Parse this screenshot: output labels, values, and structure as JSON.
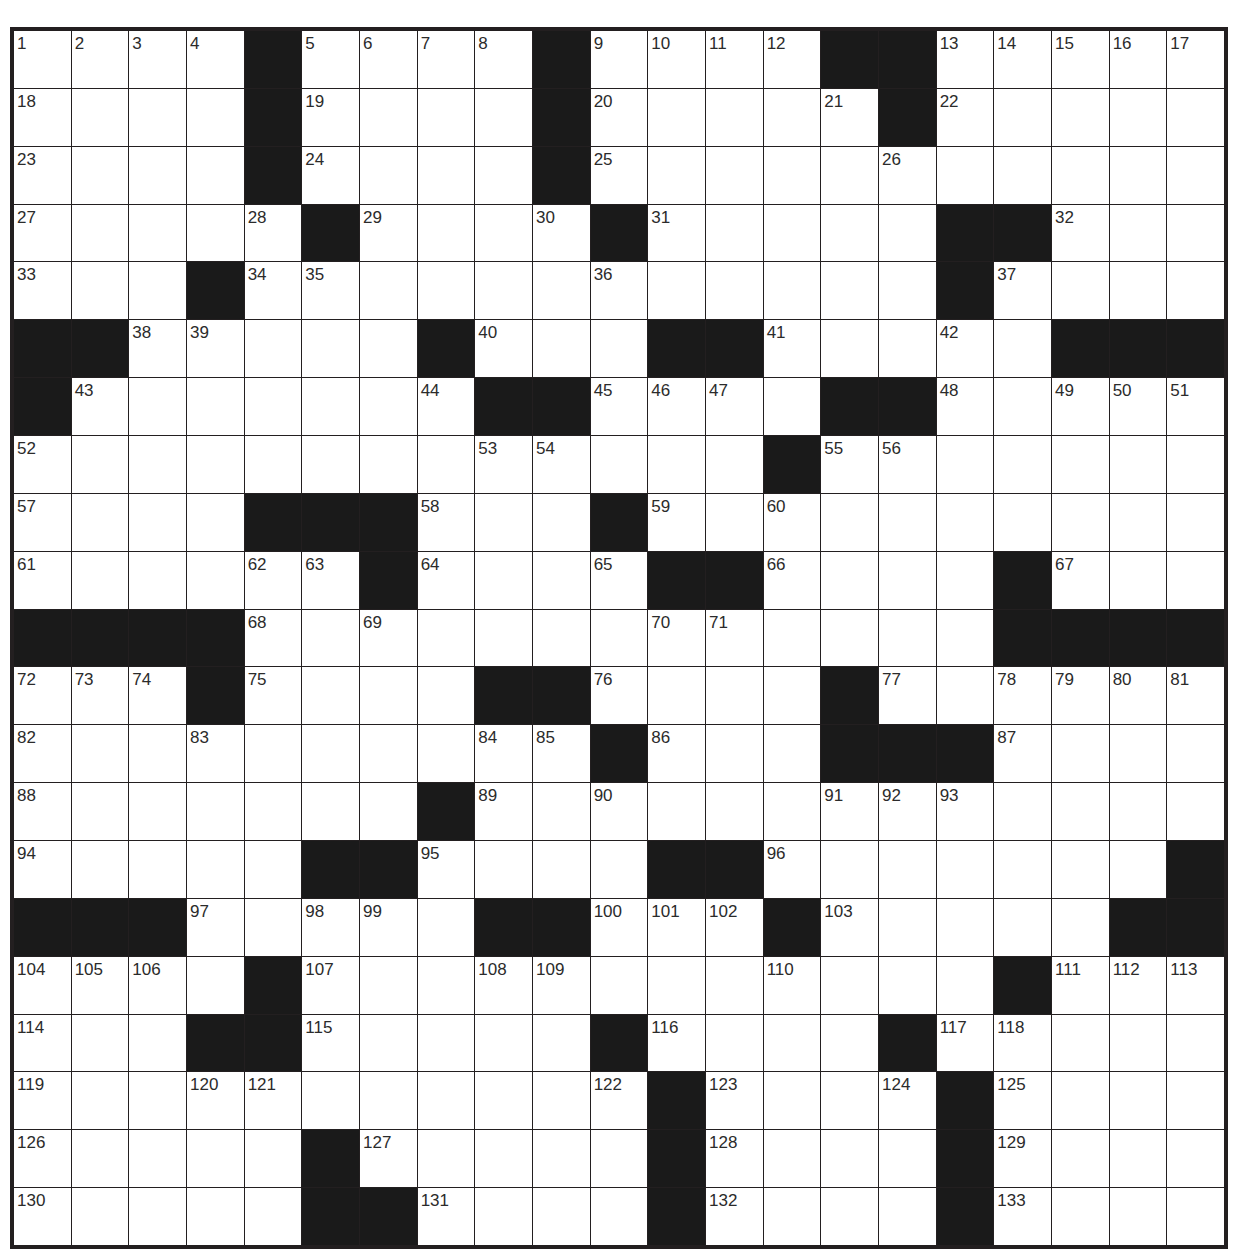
{
  "puzzle": {
    "type": "crossword",
    "size": {
      "rows": 21,
      "cols": 21
    },
    "colors": {
      "black_cell": "#1a1a1a",
      "white_cell": "#ffffff",
      "grid_line": "#231f20"
    },
    "layout": [
      "....#....#....##.....",
      "....#....#.....#.....",
      "....#....#...........",
      ".....#....#.....##...",
      "...#............#....",
      "##.....#...##.....###",
      "#.......##....##.....",
      ".............#.......",
      "....###...#..........",
      "......#....##....#...",
      "####.............####",
      "...#....##....#......",
      "..........#...###....",
      ".......#.............",
      ".....##....##.......#",
      "###.....##...#.....##",
      "....#............#...",
      "...##.....#....#.....",
      "...........#....#....",
      ".....#.....#....#....",
      ".....##....#....#...."
    ],
    "numbers": [
      {
        "r": 0,
        "c": 0,
        "n": "1"
      },
      {
        "r": 0,
        "c": 1,
        "n": "2"
      },
      {
        "r": 0,
        "c": 2,
        "n": "3"
      },
      {
        "r": 0,
        "c": 3,
        "n": "4"
      },
      {
        "r": 0,
        "c": 5,
        "n": "5"
      },
      {
        "r": 0,
        "c": 6,
        "n": "6"
      },
      {
        "r": 0,
        "c": 7,
        "n": "7"
      },
      {
        "r": 0,
        "c": 8,
        "n": "8"
      },
      {
        "r": 0,
        "c": 10,
        "n": "9"
      },
      {
        "r": 0,
        "c": 11,
        "n": "10"
      },
      {
        "r": 0,
        "c": 12,
        "n": "11"
      },
      {
        "r": 0,
        "c": 13,
        "n": "12"
      },
      {
        "r": 0,
        "c": 16,
        "n": "13"
      },
      {
        "r": 0,
        "c": 17,
        "n": "14"
      },
      {
        "r": 0,
        "c": 18,
        "n": "15"
      },
      {
        "r": 0,
        "c": 19,
        "n": "16"
      },
      {
        "r": 0,
        "c": 20,
        "n": "17"
      },
      {
        "r": 1,
        "c": 0,
        "n": "18"
      },
      {
        "r": 1,
        "c": 5,
        "n": "19"
      },
      {
        "r": 1,
        "c": 10,
        "n": "20"
      },
      {
        "r": 1,
        "c": 14,
        "n": "21"
      },
      {
        "r": 1,
        "c": 16,
        "n": "22"
      },
      {
        "r": 2,
        "c": 0,
        "n": "23"
      },
      {
        "r": 2,
        "c": 5,
        "n": "24"
      },
      {
        "r": 2,
        "c": 10,
        "n": "25"
      },
      {
        "r": 2,
        "c": 15,
        "n": "26"
      },
      {
        "r": 3,
        "c": 0,
        "n": "27"
      },
      {
        "r": 3,
        "c": 4,
        "n": "28"
      },
      {
        "r": 3,
        "c": 6,
        "n": "29"
      },
      {
        "r": 3,
        "c": 9,
        "n": "30"
      },
      {
        "r": 3,
        "c": 11,
        "n": "31"
      },
      {
        "r": 3,
        "c": 18,
        "n": "32"
      },
      {
        "r": 4,
        "c": 0,
        "n": "33"
      },
      {
        "r": 4,
        "c": 4,
        "n": "34"
      },
      {
        "r": 4,
        "c": 5,
        "n": "35"
      },
      {
        "r": 4,
        "c": 10,
        "n": "36"
      },
      {
        "r": 4,
        "c": 17,
        "n": "37"
      },
      {
        "r": 5,
        "c": 2,
        "n": "38"
      },
      {
        "r": 5,
        "c": 3,
        "n": "39"
      },
      {
        "r": 5,
        "c": 8,
        "n": "40"
      },
      {
        "r": 5,
        "c": 13,
        "n": "41"
      },
      {
        "r": 5,
        "c": 16,
        "n": "42"
      },
      {
        "r": 6,
        "c": 1,
        "n": "43"
      },
      {
        "r": 6,
        "c": 7,
        "n": "44"
      },
      {
        "r": 6,
        "c": 10,
        "n": "45"
      },
      {
        "r": 6,
        "c": 11,
        "n": "46"
      },
      {
        "r": 6,
        "c": 12,
        "n": "47"
      },
      {
        "r": 6,
        "c": 16,
        "n": "48"
      },
      {
        "r": 6,
        "c": 18,
        "n": "49"
      },
      {
        "r": 6,
        "c": 19,
        "n": "50"
      },
      {
        "r": 6,
        "c": 20,
        "n": "51"
      },
      {
        "r": 7,
        "c": 0,
        "n": "52"
      },
      {
        "r": 7,
        "c": 8,
        "n": "53"
      },
      {
        "r": 7,
        "c": 9,
        "n": "54"
      },
      {
        "r": 7,
        "c": 14,
        "n": "55"
      },
      {
        "r": 7,
        "c": 15,
        "n": "56"
      },
      {
        "r": 8,
        "c": 0,
        "n": "57"
      },
      {
        "r": 8,
        "c": 7,
        "n": "58"
      },
      {
        "r": 8,
        "c": 11,
        "n": "59"
      },
      {
        "r": 8,
        "c": 13,
        "n": "60"
      },
      {
        "r": 9,
        "c": 0,
        "n": "61"
      },
      {
        "r": 9,
        "c": 4,
        "n": "62"
      },
      {
        "r": 9,
        "c": 5,
        "n": "63"
      },
      {
        "r": 9,
        "c": 7,
        "n": "64"
      },
      {
        "r": 9,
        "c": 10,
        "n": "65"
      },
      {
        "r": 9,
        "c": 13,
        "n": "66"
      },
      {
        "r": 9,
        "c": 18,
        "n": "67"
      },
      {
        "r": 10,
        "c": 4,
        "n": "68"
      },
      {
        "r": 10,
        "c": 6,
        "n": "69"
      },
      {
        "r": 10,
        "c": 11,
        "n": "70"
      },
      {
        "r": 10,
        "c": 12,
        "n": "71"
      },
      {
        "r": 11,
        "c": 0,
        "n": "72"
      },
      {
        "r": 11,
        "c": 1,
        "n": "73"
      },
      {
        "r": 11,
        "c": 2,
        "n": "74"
      },
      {
        "r": 11,
        "c": 4,
        "n": "75"
      },
      {
        "r": 11,
        "c": 10,
        "n": "76"
      },
      {
        "r": 11,
        "c": 15,
        "n": "77"
      },
      {
        "r": 11,
        "c": 17,
        "n": "78"
      },
      {
        "r": 11,
        "c": 18,
        "n": "79"
      },
      {
        "r": 11,
        "c": 19,
        "n": "80"
      },
      {
        "r": 11,
        "c": 20,
        "n": "81"
      },
      {
        "r": 12,
        "c": 0,
        "n": "82"
      },
      {
        "r": 12,
        "c": 3,
        "n": "83"
      },
      {
        "r": 12,
        "c": 8,
        "n": "84"
      },
      {
        "r": 12,
        "c": 9,
        "n": "85"
      },
      {
        "r": 12,
        "c": 11,
        "n": "86"
      },
      {
        "r": 12,
        "c": 17,
        "n": "87"
      },
      {
        "r": 13,
        "c": 0,
        "n": "88"
      },
      {
        "r": 13,
        "c": 8,
        "n": "89"
      },
      {
        "r": 13,
        "c": 10,
        "n": "90"
      },
      {
        "r": 13,
        "c": 14,
        "n": "91"
      },
      {
        "r": 13,
        "c": 15,
        "n": "92"
      },
      {
        "r": 13,
        "c": 16,
        "n": "93"
      },
      {
        "r": 14,
        "c": 0,
        "n": "94"
      },
      {
        "r": 14,
        "c": 7,
        "n": "95"
      },
      {
        "r": 14,
        "c": 13,
        "n": "96"
      },
      {
        "r": 15,
        "c": 3,
        "n": "97"
      },
      {
        "r": 15,
        "c": 5,
        "n": "98"
      },
      {
        "r": 15,
        "c": 6,
        "n": "99"
      },
      {
        "r": 15,
        "c": 10,
        "n": "100"
      },
      {
        "r": 15,
        "c": 11,
        "n": "101"
      },
      {
        "r": 15,
        "c": 12,
        "n": "102"
      },
      {
        "r": 15,
        "c": 14,
        "n": "103"
      },
      {
        "r": 16,
        "c": 0,
        "n": "104"
      },
      {
        "r": 16,
        "c": 1,
        "n": "105"
      },
      {
        "r": 16,
        "c": 2,
        "n": "106"
      },
      {
        "r": 16,
        "c": 5,
        "n": "107"
      },
      {
        "r": 16,
        "c": 8,
        "n": "108"
      },
      {
        "r": 16,
        "c": 9,
        "n": "109"
      },
      {
        "r": 16,
        "c": 13,
        "n": "110"
      },
      {
        "r": 16,
        "c": 18,
        "n": "111"
      },
      {
        "r": 16,
        "c": 19,
        "n": "112"
      },
      {
        "r": 16,
        "c": 20,
        "n": "113"
      },
      {
        "r": 17,
        "c": 0,
        "n": "114"
      },
      {
        "r": 17,
        "c": 5,
        "n": "115"
      },
      {
        "r": 17,
        "c": 11,
        "n": "116"
      },
      {
        "r": 17,
        "c": 16,
        "n": "117"
      },
      {
        "r": 17,
        "c": 17,
        "n": "118"
      },
      {
        "r": 18,
        "c": 0,
        "n": "119"
      },
      {
        "r": 18,
        "c": 3,
        "n": "120"
      },
      {
        "r": 18,
        "c": 4,
        "n": "121"
      },
      {
        "r": 18,
        "c": 10,
        "n": "122"
      },
      {
        "r": 18,
        "c": 12,
        "n": "123"
      },
      {
        "r": 18,
        "c": 15,
        "n": "124"
      },
      {
        "r": 18,
        "c": 17,
        "n": "125"
      },
      {
        "r": 19,
        "c": 0,
        "n": "126"
      },
      {
        "r": 19,
        "c": 6,
        "n": "127"
      },
      {
        "r": 19,
        "c": 12,
        "n": "128"
      },
      {
        "r": 19,
        "c": 17,
        "n": "129"
      },
      {
        "r": 20,
        "c": 0,
        "n": "130"
      },
      {
        "r": 20,
        "c": 7,
        "n": "131"
      },
      {
        "r": 20,
        "c": 12,
        "n": "132"
      },
      {
        "r": 20,
        "c": 17,
        "n": "133"
      }
    ]
  }
}
